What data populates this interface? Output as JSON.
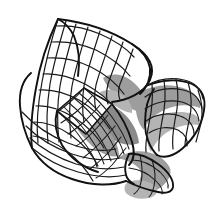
{
  "figure": {
    "title": "Wireframe saddle surface",
    "kind": "mathematical-surface-wireframe",
    "background_color": "#ffffff",
    "canvas": {
      "width": 220,
      "height": 216
    }
  },
  "palette": {
    "background": "#ffffff",
    "mesh_line": "#1a1a1a",
    "silhouette_line": "#111111",
    "shade_gray": "#9d9d9d",
    "shade_gray_light": "#b4b4b4",
    "shade_gray_dark": "#8a8a8a",
    "panel_white": "#fdfdfd"
  },
  "geometry": {
    "bounds": {
      "left": 18,
      "top": 18,
      "right": 205,
      "bottom": 201
    },
    "lobes": [
      {
        "name": "upper-left-wing",
        "anchor_x": 70,
        "anchor_y": 40
      },
      {
        "name": "upper-right-wing",
        "anchor_x": 150,
        "anchor_y": 55
      },
      {
        "name": "right-wing",
        "anchor_x": 185,
        "anchor_y": 115
      },
      {
        "name": "lower-left-wing",
        "anchor_x": 50,
        "anchor_y": 155
      },
      {
        "name": "lower-tongue",
        "anchor_x": 140,
        "anchor_y": 190
      }
    ],
    "center_panel": {
      "name": "flat-quad-panel",
      "cx": 80,
      "cy": 112
    },
    "mesh": {
      "u_lines": 11,
      "v_lines": 11,
      "line_width": 1.25
    }
  },
  "shaded_regions": [
    {
      "name": "upper-center-shade",
      "tone": "#9d9d9d"
    },
    {
      "name": "right-lobe-shade",
      "tone": "#9d9d9d"
    },
    {
      "name": "center-dense-shade",
      "tone": "#8a8a8a"
    },
    {
      "name": "lower-tongue-shade",
      "tone": "#9d9d9d"
    },
    {
      "name": "lower-right-shade",
      "tone": "#b4b4b4"
    }
  ],
  "labels": {
    "none_present": "",
    "axis_labels": [],
    "legend": []
  }
}
